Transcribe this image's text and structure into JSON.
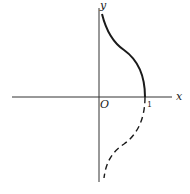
{
  "figure": {
    "type": "function-plot",
    "axes": {
      "x_label": "x",
      "y_label": "y",
      "origin_label": "O",
      "x_tick_label": "1"
    },
    "curves": [
      {
        "name": "upper-branch",
        "style": "solid",
        "from": [
          1,
          0
        ],
        "toward": [
          0,
          "+inf"
        ]
      },
      {
        "name": "lower-branch",
        "style": "dashed",
        "from": [
          1,
          0
        ],
        "toward": [
          0,
          "-inf"
        ]
      }
    ],
    "colors": {
      "line": "#1a1a1a",
      "background": "#ffffff"
    }
  }
}
